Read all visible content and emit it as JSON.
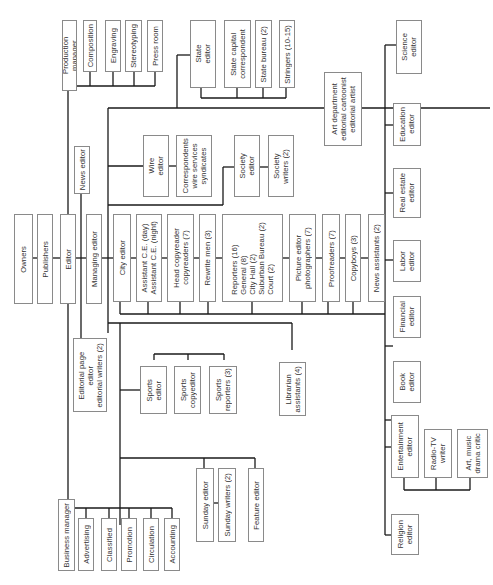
{
  "chart_title": "",
  "colors": {
    "line": "#1a1a1a",
    "box_border": "#8a8a8a",
    "text": "#333333",
    "background": "#ffffff"
  },
  "nodes": {
    "owners": "Owners",
    "publishers": "Publishers",
    "editor": "Editor",
    "managing_editor": "Managing editor",
    "news_editor": "News editor",
    "editorial_page": "Editorial page\neditor\neditorial writers (2)",
    "production_manager": "Production manager",
    "composition": "Composition",
    "engraving": "Engraving",
    "stereotyping": "Stereotyping",
    "press_room": "Press room",
    "state_editor": "State\neditor",
    "state_capital": "State capital\ncorrespondent",
    "state_bureau": "State bureau (2)",
    "stringers": "Stringers (10-15)",
    "art_department": "Art department\neditorial cartoonist\neditorial artist",
    "wire_editor": "Wire\neditor",
    "correspondents": "Correspondents\nwire services\nsyndicates",
    "society_editor": "Society\neditor",
    "society_writers": "Society\nwriters (2)",
    "city_editor": "City editor",
    "assistant_ce": "Assistant C.E. (day)\nAssistant C.E. (night)",
    "head_copyreader": "Head copyreader\ncopyreaders (7)",
    "rewrite_men": "Rewrite men (3)",
    "reporters": "Reporters (16)\nGeneral (8)\nCity Hall (2)\nSuburban Bureau (2)\nCourt (2)",
    "picture_editor": "Picture editor\nphotographers (7)",
    "proofreaders": "Proofreaders (7)",
    "copyboys": "Copyboys (3)",
    "news_assistants": "News assistants (2)",
    "science_editor": "Science\neditor",
    "education_editor": "Education\neditor",
    "real_estate_editor": "Real estate\neditor",
    "labor_editor": "Labor\neditor",
    "financial_editor": "Financial\neditor",
    "book_editor": "Book\neditor",
    "entertainment_editor": "Entertainment\neditor",
    "radio_tv_writer": "Radio-TV\nwriter",
    "art_music_critic": "Art, music\ndrama critic",
    "religion_editor": "Religion\neditor",
    "sports_editor": "Sports\neditor",
    "sports_copyeditor": "Sports\ncopyeditor",
    "sports_reporters": "Sports\nreporters (3)",
    "librarian": "Librarian\nassistants (4)",
    "sunday_editor": "Sunday editor",
    "sunday_writers": "Sunday writers (2)",
    "feature_editor": "Feature editor",
    "business_manager": "Business manager",
    "advertising": "Advertising",
    "classified": "Classified",
    "promotion": "Promotion",
    "circulation": "Circulation",
    "accounting": "Accounting"
  }
}
